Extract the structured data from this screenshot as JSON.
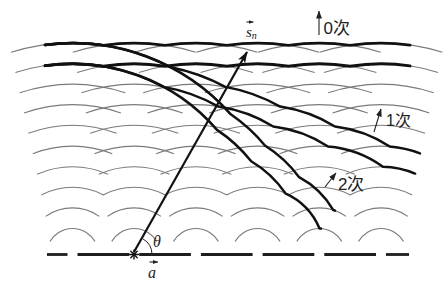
{
  "figure": {
    "labels": {
      "direction_vector": {
        "base": "s",
        "subscript": "n"
      },
      "angle": "θ",
      "grating_vector": "a",
      "orders": [
        {
          "order": 0,
          "label": "0次"
        },
        {
          "order": 1,
          "label": "1次"
        },
        {
          "order": 2,
          "label": "2次"
        }
      ]
    }
  },
  "diagram": {
    "canvas": {
      "width": 448,
      "height": 290,
      "background": "#ffffff"
    },
    "grating": {
      "y": 254.5,
      "x_start": 47,
      "x_end": 409,
      "slit_gap": 10
    },
    "slits_x": [
      72.5,
      134.2,
      195.9,
      257.6,
      319.3,
      381.0
    ],
    "source_slit_index": 1,
    "wavelet": {
      "count": 10,
      "r0": 26,
      "spacing": 20.6,
      "half_width_base": 17,
      "half_width_slope": 0.21
    },
    "wavefronts": [
      {
        "order": 0,
        "k_start": 9,
        "last_slit": 5,
        "x_start": 45,
        "x_end": 410
      },
      {
        "order": 0,
        "k_start": 8,
        "last_slit": 5,
        "x_start": 45,
        "x_end": 410
      },
      {
        "order": 1,
        "k_start": 9,
        "last_slit": 5,
        "x_start": 45,
        "x_end": 420
      },
      {
        "order": 1,
        "k_start": 8,
        "last_slit": 5,
        "x_start": 45,
        "x_end": 415
      },
      {
        "order": 2,
        "k_start": 9,
        "last_slit": 4,
        "x_start": 45,
        "x_end": 335
      },
      {
        "order": 2,
        "k_start": 8,
        "last_slit": 4,
        "x_start": 45,
        "x_end": 321
      }
    ],
    "colors": {
      "wavelet": "#7a7a7a",
      "wavefront": "#111111",
      "grating": "#1e1e1e",
      "text": "#222222"
    }
  }
}
